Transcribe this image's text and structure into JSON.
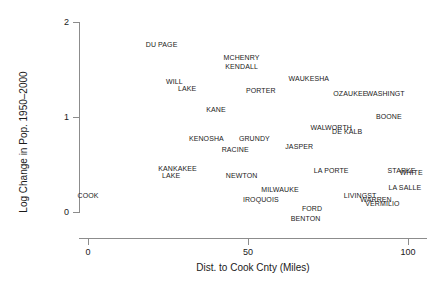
{
  "chart_data": {
    "type": "scatter",
    "title": "",
    "subtitle": "",
    "xlabel": "Dist. to Cook Cnty (Miles)",
    "ylabel": "Log Change in Pop. 1950–2000",
    "xlim": [
      -3,
      108
    ],
    "ylim": [
      -0.2,
      2.05
    ],
    "xticks": [
      0,
      50,
      100
    ],
    "xtick_labels": [
      "0",
      "50",
      "100"
    ],
    "yticks": [
      0,
      1,
      2
    ],
    "ytick_labels": [
      "0",
      "1",
      "2"
    ],
    "grid": false,
    "legend": null,
    "point_marker": "text-label",
    "note": "Each data point is drawn as the county name text at its (x, y) location.",
    "points": [
      {
        "label": "COOK",
        "x": 0,
        "y": 0.17
      },
      {
        "label": "DU PAGE",
        "x": 23,
        "y": 1.76
      },
      {
        "label": "MCHENRY",
        "x": 48,
        "y": 1.62
      },
      {
        "label": "KENDALL",
        "x": 48,
        "y": 1.53
      },
      {
        "label": "WILL",
        "x": 27,
        "y": 1.37
      },
      {
        "label": "LAKE",
        "x": 31,
        "y": 1.3
      },
      {
        "label": "WAUKESHA",
        "x": 69,
        "y": 1.4
      },
      {
        "label": "PORTER",
        "x": 54,
        "y": 1.27
      },
      {
        "label": "OZAUKEE",
        "x": 82,
        "y": 1.24
      },
      {
        "label": "WASHINGT",
        "x": 93,
        "y": 1.24
      },
      {
        "label": "KANE",
        "x": 40,
        "y": 1.07
      },
      {
        "label": "BOONE",
        "x": 94,
        "y": 1.0
      },
      {
        "label": "WALWORTH",
        "x": 76,
        "y": 0.88
      },
      {
        "label": "DE KALB",
        "x": 81,
        "y": 0.84
      },
      {
        "label": "KENOSHA",
        "x": 37,
        "y": 0.77
      },
      {
        "label": "GRUNDY",
        "x": 52,
        "y": 0.77
      },
      {
        "label": "JASPER",
        "x": 66,
        "y": 0.68
      },
      {
        "label": "RACINE",
        "x": 46,
        "y": 0.65
      },
      {
        "label": "KANKAKEE",
        "x": 28,
        "y": 0.45
      },
      {
        "label": "LAKE",
        "x": 26,
        "y": 0.38
      },
      {
        "label": "NEWTON",
        "x": 48,
        "y": 0.38
      },
      {
        "label": "LA PORTE",
        "x": 76,
        "y": 0.43
      },
      {
        "label": "STARKE",
        "x": 98,
        "y": 0.43
      },
      {
        "label": "WHITE",
        "x": 101,
        "y": 0.41
      },
      {
        "label": "MILWAUKE",
        "x": 60,
        "y": 0.23
      },
      {
        "label": "LA SALLE",
        "x": 99,
        "y": 0.25
      },
      {
        "label": "IROQUOIS",
        "x": 54,
        "y": 0.13
      },
      {
        "label": "LIVINGST",
        "x": 85,
        "y": 0.17
      },
      {
        "label": "WARREN",
        "x": 90,
        "y": 0.13
      },
      {
        "label": "VERMILIO",
        "x": 92,
        "y": 0.08
      },
      {
        "label": "FORD",
        "x": 70,
        "y": 0.03
      },
      {
        "label": "BENTON",
        "x": 68,
        "y": -0.07
      }
    ]
  },
  "axes": {
    "x_title": "Dist. to Cook Cnty (Miles)",
    "y_title": "Log Change in Pop. 1950–2000"
  }
}
